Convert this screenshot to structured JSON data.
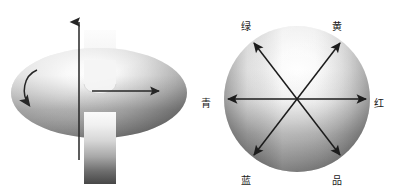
{
  "figure": {
    "kind": "two-panel-greyscale-diagram",
    "panels": [
      {
        "id": "rotating-disc",
        "name": "rotating-gradient-disc",
        "elements": {
          "disc_label": "",
          "vertical_axis_arrow": "up",
          "radius_arrow": "right",
          "rotation_arrow": "clockwise",
          "band_orientation": "vertical",
          "band_gradient_top": "#f2f2f2",
          "band_gradient_bottom": "#4a4a4a"
        }
      },
      {
        "id": "color-wheel",
        "name": "color-wheel-axes",
        "labels": [
          {
            "key": "green",
            "text": "绿",
            "angle_deg": 120,
            "x": 246,
            "y": 26
          },
          {
            "key": "yellow",
            "text": "黄",
            "angle_deg": 60,
            "x": 337,
            "y": 26
          },
          {
            "key": "cyan",
            "text": "青",
            "angle_deg": 180,
            "x": 205,
            "y": 103
          },
          {
            "key": "red",
            "text": "红",
            "angle_deg": 0,
            "x": 374,
            "y": 103
          },
          {
            "key": "blue",
            "text": "蓝",
            "angle_deg": 240,
            "x": 246,
            "y": 180
          },
          {
            "key": "magenta",
            "text": "品",
            "angle_deg": 300,
            "x": 337,
            "y": 180
          }
        ],
        "axes": [
          {
            "name": "cyan-red-axis",
            "label_a": "青",
            "label_b": "红"
          },
          {
            "name": "green-magenta-axis",
            "label_a": "绿",
            "label_b": "品"
          },
          {
            "name": "yellow-blue-axis",
            "label_a": "黄",
            "label_b": "蓝"
          }
        ]
      }
    ],
    "colors": {
      "background": "#ffffff",
      "ink": "#1a1a1a",
      "grey_light": "#fdfdfd",
      "grey_mid": "#b5b5b5",
      "grey_dark": "#5a5a5a",
      "grey_darkest": "#3c3c3c"
    }
  }
}
